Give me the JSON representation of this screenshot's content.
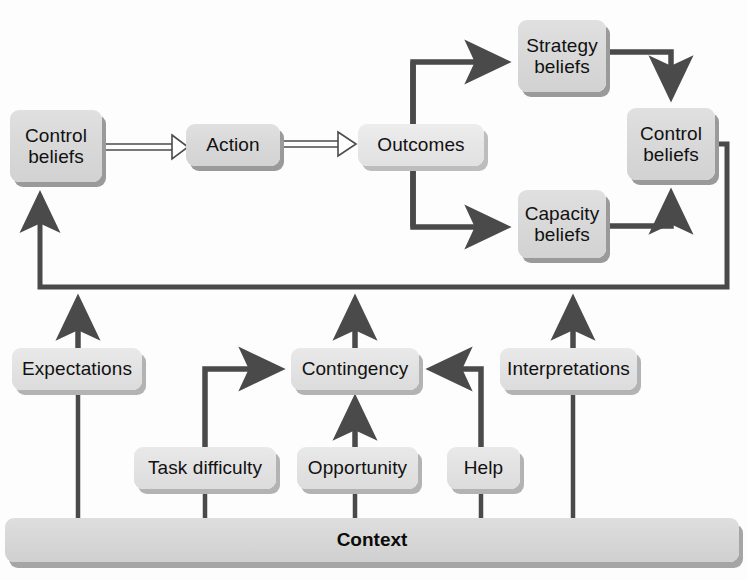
{
  "diagram": {
    "colors": {
      "wire": "#4a4a4a",
      "node_fill": "#dcdcdc",
      "node_shadow": "#9a9a9a",
      "hollow_arrow_fill": "#ffffff",
      "text": "#111111",
      "background": "#fdfdfd"
    },
    "nodes": [
      {
        "id": "control-beliefs-left",
        "label": "Control\nbeliefs",
        "style": "solid",
        "x": 10,
        "y": 110,
        "w": 92,
        "h": 72
      },
      {
        "id": "action",
        "label": "Action",
        "style": "solid",
        "x": 186,
        "y": 124,
        "w": 94,
        "h": 42
      },
      {
        "id": "outcomes",
        "label": "Outcomes",
        "style": "pale",
        "x": 358,
        "y": 124,
        "w": 126,
        "h": 42
      },
      {
        "id": "strategy-beliefs",
        "label": "Strategy\nbeliefs",
        "style": "solid",
        "x": 518,
        "y": 20,
        "w": 88,
        "h": 72
      },
      {
        "id": "capacity-beliefs",
        "label": "Capacity\nbeliefs",
        "style": "solid",
        "x": 518,
        "y": 190,
        "w": 88,
        "h": 68
      },
      {
        "id": "control-beliefs-right",
        "label": "Control\nbeliefs",
        "style": "solid",
        "x": 627,
        "y": 108,
        "w": 88,
        "h": 72
      },
      {
        "id": "expectations",
        "label": "Expectations",
        "style": "light",
        "x": 12,
        "y": 348,
        "w": 130,
        "h": 42
      },
      {
        "id": "contingency",
        "label": "Contingency",
        "style": "light",
        "x": 291,
        "y": 348,
        "w": 128,
        "h": 42
      },
      {
        "id": "interpretations",
        "label": "Interpretations",
        "style": "light",
        "x": 500,
        "y": 348,
        "w": 137,
        "h": 42
      },
      {
        "id": "task-difficulty",
        "label": "Task difficulty",
        "style": "light",
        "x": 134,
        "y": 447,
        "w": 142,
        "h": 42
      },
      {
        "id": "opportunity",
        "label": "Opportunity",
        "style": "light",
        "x": 297,
        "y": 447,
        "w": 121,
        "h": 42
      },
      {
        "id": "help",
        "label": "Help",
        "style": "light",
        "x": 447,
        "y": 447,
        "w": 73,
        "h": 42
      }
    ],
    "context": {
      "label": "Context",
      "x": 5,
      "y": 518,
      "w": 734,
      "h": 44
    },
    "edges": [
      {
        "id": "control-to-action",
        "from": "control-beliefs-left",
        "to": "action",
        "arrow": "hollow"
      },
      {
        "id": "action-to-outcomes",
        "from": "action",
        "to": "outcomes",
        "arrow": "hollow"
      },
      {
        "id": "outcomes-to-strategy",
        "from": "outcomes",
        "to": "strategy-beliefs",
        "arrow": "solid"
      },
      {
        "id": "outcomes-to-capacity",
        "from": "outcomes",
        "to": "capacity-beliefs",
        "arrow": "solid"
      },
      {
        "id": "strategy-to-control-right",
        "from": "strategy-beliefs",
        "to": "control-beliefs-right",
        "arrow": "solid"
      },
      {
        "id": "capacity-to-control-right",
        "from": "capacity-beliefs",
        "to": "control-beliefs-right",
        "arrow": "solid"
      },
      {
        "id": "control-right-to-control-left",
        "from": "control-beliefs-right",
        "to": "control-beliefs-left",
        "arrow": "solid"
      },
      {
        "id": "expectations-to-feedback",
        "from": "expectations",
        "to": "feedback-bus",
        "arrow": "solid"
      },
      {
        "id": "contingency-to-feedback",
        "from": "contingency",
        "to": "feedback-bus",
        "arrow": "solid"
      },
      {
        "id": "interpretations-to-feedback",
        "from": "interpretations",
        "to": "feedback-bus",
        "arrow": "solid"
      },
      {
        "id": "task-difficulty-to-contingency",
        "from": "task-difficulty",
        "to": "contingency",
        "arrow": "solid"
      },
      {
        "id": "opportunity-to-contingency",
        "from": "opportunity",
        "to": "contingency",
        "arrow": "solid"
      },
      {
        "id": "help-to-contingency",
        "from": "help",
        "to": "contingency",
        "arrow": "solid"
      },
      {
        "id": "context-to-expectations",
        "from": "context",
        "to": "expectations",
        "arrow": "none"
      },
      {
        "id": "context-to-task-difficulty",
        "from": "context",
        "to": "task-difficulty",
        "arrow": "none"
      },
      {
        "id": "context-to-opportunity",
        "from": "context",
        "to": "opportunity",
        "arrow": "none"
      },
      {
        "id": "context-to-help",
        "from": "context",
        "to": "help",
        "arrow": "none"
      },
      {
        "id": "context-to-interpretations",
        "from": "context",
        "to": "interpretations",
        "arrow": "none"
      }
    ]
  }
}
